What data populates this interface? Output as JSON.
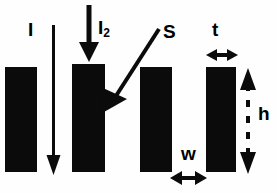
{
  "figure": {
    "background_color": "#fefefe",
    "ink_color": "#000000",
    "width": 277,
    "height": 193,
    "labels": {
      "incident_beam": "I",
      "second_beam": "I",
      "second_beam_subscript": "2",
      "scattered_beam": "S",
      "thickness": "t",
      "width": "w",
      "height": "h"
    },
    "bars": [
      {
        "name": "bar-1",
        "x": 5,
        "y": 67,
        "width": 32,
        "height": 105
      },
      {
        "name": "bar-2",
        "x": 72,
        "y": 64,
        "width": 33,
        "height": 108
      },
      {
        "name": "bar-3",
        "x": 140,
        "y": 67,
        "width": 32,
        "height": 105
      },
      {
        "name": "bar-4",
        "x": 206,
        "y": 67,
        "width": 30,
        "height": 105
      }
    ],
    "arrows": [
      {
        "name": "arrow-I",
        "type": "line-down",
        "x1": 53,
        "y1": 25,
        "x2": 53,
        "y2": 170
      },
      {
        "name": "arrow-I2",
        "type": "thick-down",
        "x1": 89,
        "y1": 5,
        "x2": 89,
        "y2": 62
      },
      {
        "name": "arrow-S",
        "type": "diagonal-down",
        "x1": 158,
        "y1": 30,
        "x2": 106,
        "y2": 111
      },
      {
        "name": "arrow-t",
        "type": "double-horizontal",
        "x1": 207,
        "y1": 55,
        "x2": 236,
        "y2": 55
      },
      {
        "name": "arrow-w",
        "type": "double-horizontal",
        "x1": 171,
        "y1": 178,
        "x2": 206,
        "y2": 178
      },
      {
        "name": "arrow-h",
        "type": "double-vertical-dashed",
        "x1": 248,
        "y1": 70,
        "x2": 248,
        "y2": 172
      }
    ]
  }
}
